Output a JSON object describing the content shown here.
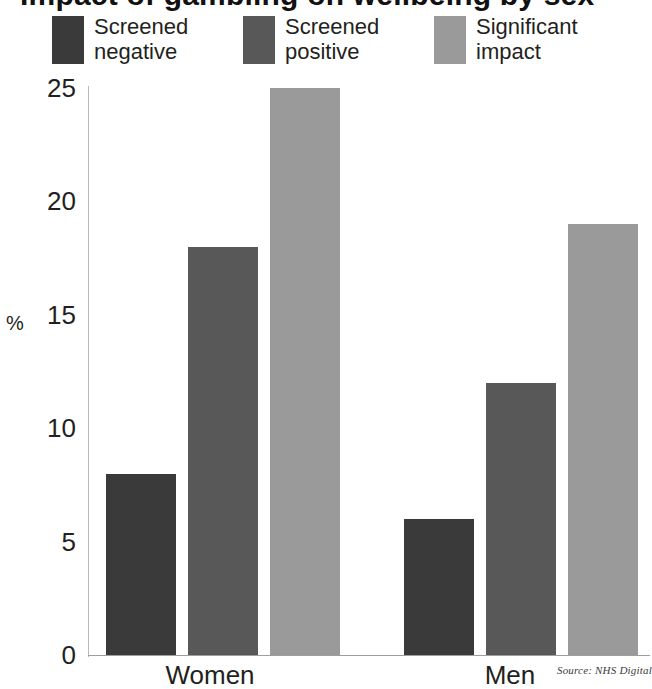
{
  "figure": {
    "title_cutoff": "Impact of gambling on wellbeing by sex",
    "source_note": "Source: NHS Digital"
  },
  "legend": {
    "items": [
      {
        "label_line1": "Screened",
        "label_line2": "negative",
        "color": "#3a3a3a",
        "swatch_name": "legend-swatch-screened-negative"
      },
      {
        "label_line1": "Screened",
        "label_line2": "positive",
        "color": "#585858",
        "swatch_name": "legend-swatch-screened-positive"
      },
      {
        "label_line1": "Significant",
        "label_line2": "impact",
        "color": "#9a9a9a",
        "swatch_name": "legend-swatch-significant-impact"
      }
    ]
  },
  "axes": {
    "y_title": "%",
    "y_ticks": [
      "25",
      "20",
      "15",
      "10",
      "5",
      "0"
    ],
    "x_ticks": [
      "Women",
      "Men"
    ]
  },
  "chart_data": {
    "type": "bar",
    "title": "Impact of gambling on wellbeing by sex",
    "xlabel": "",
    "ylabel": "%",
    "ylim": [
      0,
      25
    ],
    "ytick_values": [
      0,
      5,
      10,
      15,
      20,
      25
    ],
    "grid": false,
    "legend_position": "top",
    "categories": [
      "Women",
      "Men"
    ],
    "series": [
      {
        "name": "Screened negative",
        "color": "#3a3a3a",
        "values": [
          8,
          6
        ]
      },
      {
        "name": "Screened positive",
        "color": "#585858",
        "values": [
          18,
          12
        ]
      },
      {
        "name": "Significant impact",
        "color": "#9a9a9a",
        "values": [
          25,
          19
        ]
      }
    ],
    "source": "Source: NHS Digital"
  }
}
